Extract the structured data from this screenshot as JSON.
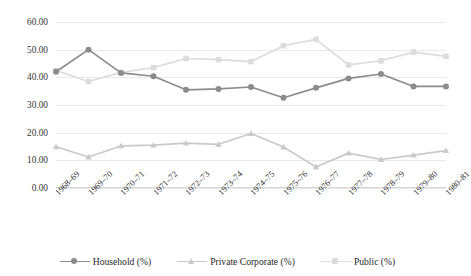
{
  "chart_data": {
    "type": "line",
    "title": "",
    "subtitle": "",
    "xlabel": "",
    "ylabel": "",
    "ylim": [
      0,
      60
    ],
    "yticks": [
      "0.00",
      "10.00",
      "20.00",
      "30.00",
      "40.00",
      "50.00",
      "60.00"
    ],
    "ytick_values": [
      0,
      10,
      20,
      30,
      40,
      50,
      60
    ],
    "grid": true,
    "legend_position": "bottom",
    "categories": [
      "1968–69",
      "1969–70",
      "1970–71",
      "1971–72",
      "1972–73",
      "1973–74",
      "1974–75",
      "1975–76",
      "1976–77",
      "1977–78",
      "1978–79",
      "1979–80",
      "1980–81"
    ],
    "series": [
      {
        "name": "Household (%)",
        "color": "#8c8c8c",
        "marker": "circle",
        "values": [
          42.0,
          50.0,
          41.6,
          40.4,
          35.5,
          35.8,
          36.5,
          32.6,
          36.2,
          39.6,
          41.2,
          36.7,
          36.7
        ]
      },
      {
        "name": "Private Corporate (%)",
        "color": "#c9c9c9",
        "marker": "triangle",
        "values": [
          14.9,
          11.2,
          15.2,
          15.5,
          16.2,
          15.8,
          19.7,
          14.8,
          7.6,
          12.6,
          10.3,
          11.9,
          13.5
        ]
      },
      {
        "name": "Public (%)",
        "color": "#dcdcdc",
        "marker": "square",
        "values": [
          42.5,
          38.5,
          41.8,
          43.5,
          46.8,
          46.4,
          45.7,
          51.4,
          53.7,
          44.5,
          46.0,
          49.1,
          47.6
        ]
      }
    ]
  },
  "legend": {
    "items": [
      {
        "label": "Household (%)"
      },
      {
        "label": "Private Corporate (%)"
      },
      {
        "label": "Public (%)"
      }
    ]
  },
  "colors": {
    "household": "#8c8c8c",
    "private_corporate": "#c9c9c9",
    "public": "#dcdcdc",
    "gridline": "#e9e9e9",
    "axis": "#d6d6d6",
    "text": "#2f2f2f",
    "background": "#ffffff"
  }
}
